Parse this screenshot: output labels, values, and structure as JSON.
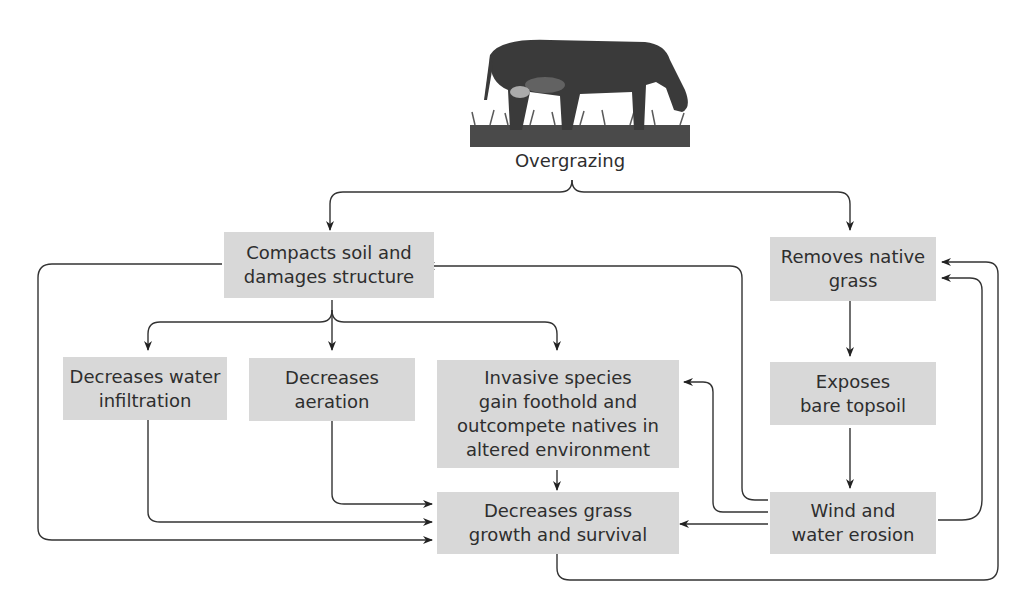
{
  "diagram": {
    "root": {
      "label": "Overgrazing",
      "icon": "grazing-cow-image"
    },
    "nodes": [
      {
        "id": "compacts",
        "label": "Compacts soil and\ndamages structure"
      },
      {
        "id": "removes",
        "label": "Removes native\ngrass"
      },
      {
        "id": "water",
        "label": "Decreases water\ninfiltration"
      },
      {
        "id": "aeration",
        "label": "Decreases\naeration"
      },
      {
        "id": "invasive",
        "label": "Invasive species\ngain foothold and\noutcompete natives in\naltered environment"
      },
      {
        "id": "exposes",
        "label": "Exposes\nbare topsoil"
      },
      {
        "id": "grass",
        "label": "Decreases grass\ngrowth and survival"
      },
      {
        "id": "erosion",
        "label": "Wind and\nwater erosion"
      }
    ],
    "edges": [
      [
        "Overgrazing",
        "compacts"
      ],
      [
        "Overgrazing",
        "removes"
      ],
      [
        "compacts",
        "water"
      ],
      [
        "compacts",
        "aeration"
      ],
      [
        "compacts",
        "invasive"
      ],
      [
        "compacts",
        "grass"
      ],
      [
        "water",
        "grass"
      ],
      [
        "aeration",
        "grass"
      ],
      [
        "invasive",
        "grass"
      ],
      [
        "removes",
        "exposes"
      ],
      [
        "exposes",
        "erosion"
      ],
      [
        "erosion",
        "grass"
      ],
      [
        "erosion",
        "invasive"
      ],
      [
        "erosion",
        "compacts"
      ],
      [
        "erosion",
        "removes"
      ],
      [
        "grass",
        "removes"
      ]
    ],
    "colors": {
      "box_fill": "#d8d8d8",
      "line": "#333333",
      "text": "#2e2e2e"
    }
  }
}
